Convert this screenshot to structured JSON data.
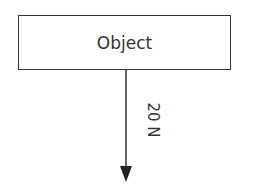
{
  "diagram": {
    "object_label": "Object",
    "force_label": "20 N",
    "arrow_direction": "down",
    "stroke_color": "#333333"
  }
}
